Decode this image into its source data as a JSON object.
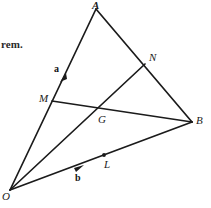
{
  "figure": {
    "caption_fragment": "rem.",
    "type": "geometry-diagram",
    "ink_color": "#1b1b1b",
    "background_color": "#ffffff",
    "points": [
      {
        "name": "A",
        "label": "A",
        "x": 96,
        "y": 9
      },
      {
        "name": "O",
        "label": "O",
        "x": 10,
        "y": 190
      },
      {
        "name": "B",
        "label": "B",
        "x": 192,
        "y": 122
      },
      {
        "name": "N",
        "label": "N",
        "x": 145,
        "y": 64
      },
      {
        "name": "M",
        "label": "M",
        "x": 52,
        "y": 101
      },
      {
        "name": "G",
        "label": "G",
        "x": 100,
        "y": 111
      },
      {
        "name": "L",
        "label": "L",
        "x": 104,
        "y": 155
      }
    ],
    "segments": [
      {
        "name": "segment-OA",
        "from": "O",
        "to": "A"
      },
      {
        "name": "segment-AB",
        "from": "A",
        "to": "B"
      },
      {
        "name": "segment-OB",
        "from": "O",
        "to": "B"
      },
      {
        "name": "segment-MB",
        "from": "M",
        "to": "B"
      },
      {
        "name": "segment-ON",
        "from": "O",
        "to": "N"
      }
    ],
    "marked_dots": [
      {
        "name": "dot-a-on-OA",
        "x": 63,
        "y": 78
      },
      {
        "name": "dot-L-on-OB",
        "x": 104,
        "y": 155
      },
      {
        "name": "dot-b-on-OB",
        "x": 79,
        "y": 168
      }
    ],
    "vectors": [
      {
        "name": "vector-a",
        "label": "a",
        "along": "segment-OA"
      },
      {
        "name": "vector-b",
        "label": "b",
        "along": "segment-OB"
      }
    ]
  }
}
